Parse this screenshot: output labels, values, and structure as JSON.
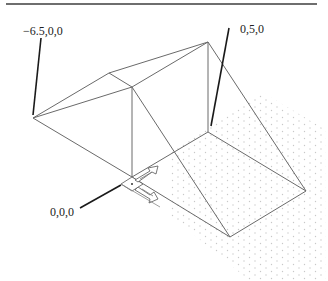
{
  "figure": {
    "labels": {
      "left_point": "−6.5,0,0",
      "right_point": "0,5,0",
      "origin_point": "0,0,0"
    },
    "colors": {
      "rule": "#6e6e6e",
      "wireframe": "#6a6a6a",
      "leader": "#1a1a1a",
      "grid_dots": "#c8c8c8",
      "text": "#222222"
    },
    "icons": {
      "ucs": "ucs-icon"
    }
  }
}
